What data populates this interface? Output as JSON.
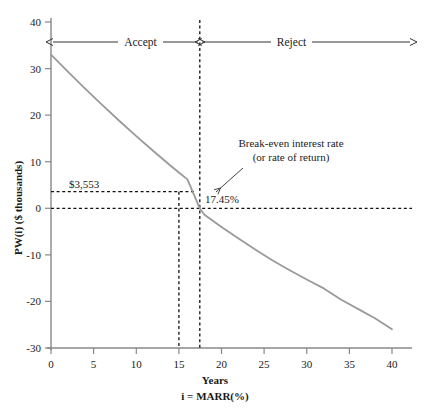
{
  "chart_data": {
    "type": "line",
    "title": "",
    "xlabel": "i = MARR(%)",
    "xlabel_secondary": "Years",
    "ylabel": "PW(i) ($ thousands)",
    "xlim": [
      0,
      42
    ],
    "ylim": [
      -30,
      40
    ],
    "xticks": [
      0,
      5,
      10,
      15,
      20,
      25,
      30,
      35,
      40
    ],
    "xticklabels": [
      "0",
      "5",
      "10",
      "15",
      "20",
      "25",
      "30",
      "35",
      "40"
    ],
    "yticks": [
      -30,
      -20,
      -10,
      0,
      10,
      20,
      30,
      40
    ],
    "yticklabels": [
      "-30",
      "-20",
      "-10",
      "0",
      "10",
      "20",
      "30",
      "40"
    ],
    "grid": false,
    "legend": false,
    "series": [
      {
        "name": "PW(i)",
        "color": "#9a9a9a",
        "x": [
          0,
          2,
          4,
          6,
          8,
          10,
          12,
          14,
          15,
          16,
          17.45,
          18,
          20,
          22,
          24,
          26,
          28,
          30,
          32,
          34,
          36,
          38,
          40
        ],
        "y": [
          33.0,
          29.3,
          25.7,
          22.2,
          18.8,
          15.5,
          12.3,
          9.2,
          7.7,
          6.2,
          0.0,
          -1.4,
          -4.0,
          -6.5,
          -8.9,
          -11.2,
          -13.3,
          -15.3,
          -17.2,
          -19.6,
          -21.6,
          -23.6,
          -26.0
        ]
      }
    ],
    "reference_lines": [
      {
        "name": "pw-at-marr-horizontal",
        "orientation": "horizontal",
        "value": 3.553,
        "style": "dashed",
        "from_x": 0,
        "to_x": 15
      },
      {
        "name": "zero-horizontal",
        "orientation": "horizontal",
        "value": 0,
        "style": "dashed",
        "from_x": 0,
        "to_x": 42
      },
      {
        "name": "marr-vertical",
        "orientation": "vertical",
        "value": 15,
        "style": "dashed",
        "from_y": -30,
        "to_y": 3.553
      },
      {
        "name": "break-even-vertical",
        "orientation": "vertical",
        "value": 17.45,
        "style": "dashed",
        "from_y": -30,
        "to_y": 40
      }
    ],
    "annotations": [
      {
        "name": "pw-value-label",
        "text": "$3,553",
        "x": 5.0,
        "y": 6.4
      },
      {
        "name": "break-even-value-label",
        "text": "17.45%",
        "x": 19.2,
        "y": 2.6
      },
      {
        "name": "break-even-callout-line1",
        "text": "Break-even interest rate",
        "x": 27.0,
        "y": 16.2
      },
      {
        "name": "break-even-callout-line2",
        "text": "(or rate of return)",
        "x": 27.0,
        "y": 13.5
      }
    ],
    "regions": [
      {
        "name": "accept-region",
        "label": "Accept",
        "from_x": 0,
        "to_x": 17.45
      },
      {
        "name": "reject-region",
        "label": "Reject",
        "from_x": 17.45,
        "to_x": 42
      }
    ],
    "colors": {
      "curve": "#9a9a9a",
      "axis": "#888888",
      "text": "#1a1a1a",
      "dashed": "#111111",
      "background": "#ffffff"
    }
  },
  "labels": {
    "ylabel": "PW(i) ($ thousands)",
    "xlabel_years": "Years",
    "xlabel_marr": "i = MARR(%)",
    "accept": "Accept",
    "reject": "Reject",
    "pw_value": "$3,553",
    "break_even_value": "17.45%",
    "callout_line1": "Break-even interest rate",
    "callout_line2": "(or rate of return)"
  }
}
